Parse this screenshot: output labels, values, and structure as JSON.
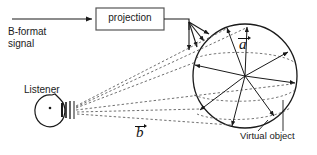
{
  "diagram": {
    "background": "#ffffff",
    "stroke": "#1a1a1a",
    "width": 317,
    "height": 155
  },
  "labels": {
    "bformat_signal": "B-format\nsignal",
    "projection": "projection",
    "listener": "Listener",
    "virtual_object": "Virtual object",
    "vector_a": "a",
    "vector_b": "b"
  },
  "nodes": {
    "projection_box": {
      "x": 96,
      "y": 8,
      "width": 68,
      "height": 22
    },
    "listener_head": {
      "cx": 55,
      "cy": 110,
      "rx": 14,
      "ry": 16
    },
    "virtual_object_circle": {
      "cx": 245,
      "cy": 76,
      "r": 52
    }
  },
  "connections": {
    "input_arrow": "B-format signal into projection box",
    "output_fan": "projection output fans into 4 downward arrows",
    "listener_rays": "6 dashed rays from listener to virtual object",
    "radial_vectors": "8 radial arrows from circle center to rim"
  }
}
